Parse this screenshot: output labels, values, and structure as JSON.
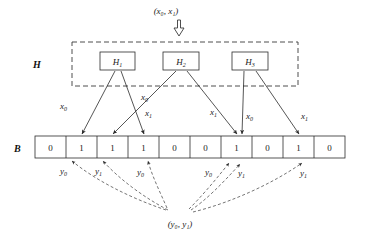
{
  "figure": {
    "title_input": "(x₀, x₁)",
    "bottom_query": "(y₀, y₁)",
    "hash_set_label": "H",
    "bit_array_label": "B",
    "hash_functions": [
      {
        "name": "H₁",
        "base": "H",
        "sub": "1"
      },
      {
        "name": "H₂",
        "base": "H",
        "sub": "2"
      },
      {
        "name": "H₃",
        "base": "H",
        "sub": "3"
      }
    ],
    "bit_array": {
      "label": "B",
      "cells": [
        "0",
        "1",
        "1",
        "1",
        "0",
        "0",
        "1",
        "0",
        "1",
        "0"
      ],
      "length": 10,
      "set_positions": [
        2,
        3,
        4,
        7,
        9
      ]
    },
    "insert_edges": [
      {
        "label": "x₀",
        "base": "x",
        "sub": "0",
        "from": "H₁",
        "to_cell": 2
      },
      {
        "label": "x₁",
        "base": "x",
        "sub": "1",
        "from": "H₁",
        "to_cell": 4
      },
      {
        "label": "x₀",
        "base": "x",
        "sub": "0",
        "from": "H₂",
        "to_cell": 3
      },
      {
        "label": "x₁",
        "base": "x",
        "sub": "1",
        "from": "H₂",
        "to_cell": 7
      },
      {
        "label": "x₀",
        "base": "x",
        "sub": "0",
        "from": "H₃",
        "to_cell": 7
      },
      {
        "label": "x₁",
        "base": "x",
        "sub": "1",
        "from": "H₃",
        "to_cell": 9
      }
    ],
    "query_edges": [
      {
        "label": "y₀",
        "base": "y",
        "sub": "0",
        "to_cell": 1
      },
      {
        "label": "y₁",
        "base": "y",
        "sub": "1",
        "to_cell": 2
      },
      {
        "label": "y₀",
        "base": "y",
        "sub": "0",
        "to_cell": 4
      },
      {
        "label": "y₀",
        "base": "y",
        "sub": "0",
        "to_cell": 6
      },
      {
        "label": "y₁",
        "base": "y",
        "sub": "1",
        "to_cell": 7
      },
      {
        "label": "y₁",
        "base": "y",
        "sub": "1",
        "to_cell": 9
      }
    ],
    "colors": {
      "ink": "#1a1a1a",
      "line": "#2b2b2b",
      "dashed": "#3a3a3a",
      "background": "#ffffff"
    }
  }
}
